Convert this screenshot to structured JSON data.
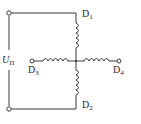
{
  "diagram": {
    "type": "circuit",
    "source": {
      "symbol": "U",
      "subscript": "П"
    },
    "windings": [
      {
        "id": "D1",
        "letter": "D",
        "index": "1",
        "position": "top"
      },
      {
        "id": "D2",
        "letter": "D",
        "index": "2",
        "position": "bottom"
      },
      {
        "id": "D3",
        "letter": "D",
        "index": "3",
        "position": "left"
      },
      {
        "id": "D4",
        "letter": "D",
        "index": "4",
        "position": "right"
      }
    ],
    "colors": {
      "line": "#3a3a3a",
      "background": "#ffffff"
    }
  }
}
